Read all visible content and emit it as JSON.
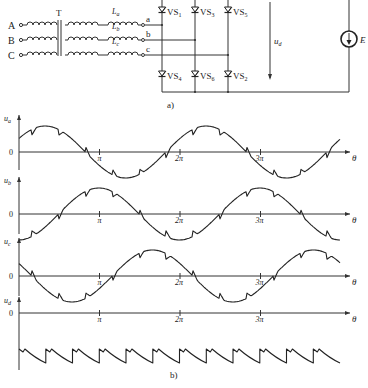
{
  "figure_a": {
    "caption": "a)",
    "phases": [
      {
        "input": "A",
        "inductor": "L_a",
        "node": "a"
      },
      {
        "input": "B",
        "inductor": "L_b",
        "node": "b"
      },
      {
        "input": "C",
        "inductor": "L_c",
        "node": "c"
      }
    ],
    "transformer_label": "T",
    "inductor_labels": {
      "a": "L",
      "a_sub": "a",
      "b": "L",
      "b_sub": "b",
      "c": "L",
      "c_sub": "c"
    },
    "thyristors_top": [
      {
        "name": "VS",
        "sub": "1"
      },
      {
        "name": "VS",
        "sub": "3"
      },
      {
        "name": "VS",
        "sub": "5"
      }
    ],
    "thyristors_bottom": [
      {
        "name": "VS",
        "sub": "4"
      },
      {
        "name": "VS",
        "sub": "6"
      },
      {
        "name": "VS",
        "sub": "2"
      }
    ],
    "output_voltage": {
      "sym": "u",
      "sub": "d"
    },
    "source": "E"
  },
  "figure_b": {
    "caption": "b)",
    "x_axis": {
      "label": "θ",
      "ticks": [
        "π",
        "2π",
        "3π"
      ]
    },
    "zero_label": "0",
    "traces": [
      {
        "sym": "u",
        "sub": "a"
      },
      {
        "sym": "u",
        "sub": "b"
      },
      {
        "sym": "u",
        "sub": "c"
      },
      {
        "sym": "u",
        "sub": "d"
      }
    ]
  },
  "chart_data": {
    "type": "line",
    "xlabel": "θ",
    "x_ticks": [
      "0",
      "π",
      "2π",
      "3π"
    ],
    "xlim": [
      0,
      3.9
    ],
    "series": [
      {
        "name": "u_a",
        "description": "phase-a voltage with commutation notches; zero crossings near π and 3π",
        "phase_offset_deg": 0
      },
      {
        "name": "u_b",
        "description": "phase-b voltage, lags u_a by 120°",
        "phase_offset_deg": -120
      },
      {
        "name": "u_c",
        "description": "phase-c voltage, lags u_a by 240°",
        "phase_offset_deg": 120
      },
      {
        "name": "u_d",
        "description": "rectified DC output voltage — sawtooth ripple with 6 pulses per period (12 visible pulses)",
        "pulses_visible": 12
      }
    ]
  }
}
